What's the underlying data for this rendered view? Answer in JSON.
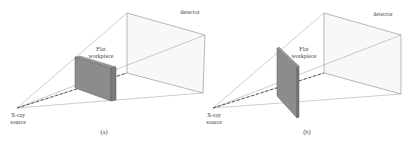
{
  "figure": {
    "panels": [
      {
        "id": "a",
        "caption": "(a)",
        "detector_label": "detector",
        "workpiece_label_line1": "Flat",
        "workpiece_label_line2": "workpiece",
        "source_label_line1": "X-ray",
        "source_label_line2": "source",
        "workpiece_orientation": "parallel to detector"
      },
      {
        "id": "b",
        "caption": "(b)",
        "detector_label": "detector",
        "workpiece_label_line1": "Flat",
        "workpiece_label_line2": "workpiece",
        "source_label_line1": "X-ray",
        "source_label_line2": "source",
        "workpiece_orientation": "rotated / oblique to detector"
      }
    ],
    "colors": {
      "line": "#8a8a8a",
      "workpiece_face": "#8c8c8c",
      "workpiece_edge": "#6e6e6e",
      "detector_fill": "#f7f7f7"
    }
  }
}
